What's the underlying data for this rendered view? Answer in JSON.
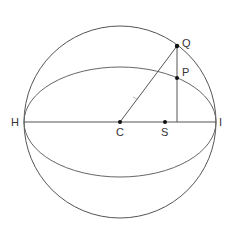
{
  "diagram": {
    "labels": {
      "H": "H",
      "C": "C",
      "S": "S",
      "I": "I",
      "Q": "Q",
      "P": "P"
    },
    "colors": {
      "stroke": "#555555",
      "point": "#111111",
      "text": "#333333"
    }
  }
}
